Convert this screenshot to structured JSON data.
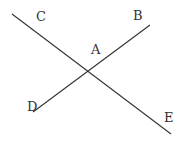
{
  "diagram": {
    "type": "intersecting-lines",
    "line_color": "#333333",
    "background": "#ffffff",
    "lines": [
      {
        "id": "CE",
        "from": "C",
        "to": "E",
        "x1": 12,
        "y1": 14,
        "x2": 171,
        "y2": 134
      },
      {
        "id": "DB",
        "from": "D",
        "to": "B",
        "x1": 33,
        "y1": 112,
        "x2": 150,
        "y2": 25
      }
    ],
    "intersection": {
      "label": "A",
      "x": 86,
      "y": 71
    },
    "labels": [
      {
        "text": "C",
        "x": 36,
        "y": 21
      },
      {
        "text": "B",
        "x": 133,
        "y": 20
      },
      {
        "text": "A",
        "x": 91,
        "y": 54
      },
      {
        "text": "D",
        "x": 27,
        "y": 111
      },
      {
        "text": "E",
        "x": 164,
        "y": 122
      }
    ]
  }
}
